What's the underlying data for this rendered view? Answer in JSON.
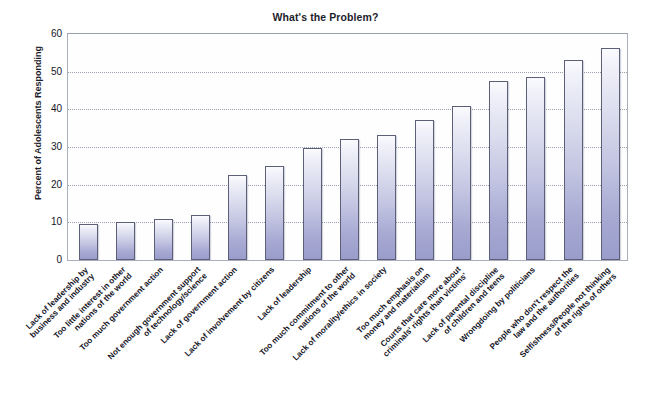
{
  "scan_bleed_text": "",
  "chart_data": {
    "type": "bar",
    "title": "What's the Problem?",
    "xlabel": "",
    "ylabel": "Percent of Adolescents Responding",
    "ylim": [
      0,
      60
    ],
    "yticks": [
      0,
      10,
      20,
      30,
      40,
      50,
      60
    ],
    "grid": true,
    "legend": "none",
    "categories": [
      "Lack of leadership by business and industry",
      "Too little interest in other nations of the world",
      "Too much government action",
      "Not enough government support of technology/science",
      "Lack of government action",
      "Lack of involvement by citizens",
      "Lack of leadership",
      "Too much commitment to other nations of the world",
      "Lack of morality/ethics in society",
      "Too much emphasis on money and materialism",
      "Courts that care more about criminals' rights than victims'",
      "Lack of parental discipline of children and teens",
      "Wrongdoing by politicians",
      "People who don't respect the law and the authorities",
      "Selfishness/People not thinking of the rights of others"
    ],
    "category_lines": [
      [
        "Lack of leadership by",
        "business and industry"
      ],
      [
        "Too little interest in other",
        "nations of the world"
      ],
      [
        "Too much government action"
      ],
      [
        "Not enough government support",
        "of technology/science"
      ],
      [
        "Lack of government action"
      ],
      [
        "Lack of involvement by citizens"
      ],
      [
        "Lack of leadership"
      ],
      [
        "Too much commitment to other",
        "nations of the world"
      ],
      [
        "Lack of morality/ethics in society"
      ],
      [
        "Too much emphasis on",
        "money and materialism"
      ],
      [
        "Courts that care more about",
        "criminals' rights than victims'"
      ],
      [
        "Lack of parental discipline",
        "of children and teens"
      ],
      [
        "Wrongdoing by politicians"
      ],
      [
        "People who don't respect the",
        "law and the authorities"
      ],
      [
        "Selfishness/People not thinking",
        "of the rights of others"
      ]
    ],
    "values": [
      9.5,
      10,
      11,
      12,
      22.5,
      25,
      29.7,
      32,
      33.3,
      37.2,
      41,
      47.5,
      48.5,
      53,
      56.4
    ],
    "bar_color": "#a9abd4",
    "bar_edge_color": "#5b5f78"
  }
}
